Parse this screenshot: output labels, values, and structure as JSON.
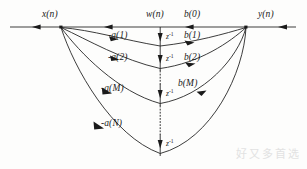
{
  "figure": {
    "type": "signal-flow-graph",
    "background_color": "#fdfdfc",
    "line_color": "#1a1a1a"
  },
  "labels": {
    "input": "x(n)",
    "state": "w(n)",
    "output": "y(n)",
    "b0": "b(0)"
  },
  "feedback_branches": [
    {
      "id": "a1",
      "label": "-a(1)",
      "x": 108,
      "y": 31
    },
    {
      "id": "a2",
      "label": "-a(2)",
      "x": 108,
      "y": 53
    },
    {
      "id": "aM",
      "label": "-a(M)",
      "x": 101,
      "y": 84
    },
    {
      "id": "aN",
      "label": "-a(N)",
      "x": 101,
      "y": 119
    }
  ],
  "feedforward_branches": [
    {
      "id": "b1",
      "label": "b(1)",
      "x": 184,
      "y": 31
    },
    {
      "id": "b2",
      "label": "b(2)",
      "x": 184,
      "y": 53
    },
    {
      "id": "bM",
      "label": "b(M)",
      "x": 178,
      "y": 79
    }
  ],
  "delay_elements": [
    {
      "id": "z1",
      "label": "z",
      "exponent": "-1",
      "x": 166,
      "y": 33
    },
    {
      "id": "z2",
      "label": "z",
      "exponent": "-1",
      "x": 166,
      "y": 55
    },
    {
      "id": "z3",
      "label": "z",
      "exponent": "-1",
      "x": 166,
      "y": 90
    },
    {
      "id": "z4",
      "label": "z",
      "exponent": "-1",
      "x": 166,
      "y": 140
    }
  ],
  "watermark": {
    "text": "好又多首选"
  },
  "geometry": {
    "main_line_y": 27,
    "left_node_x": 61,
    "right_node_x": 246,
    "delay_column_x": 160,
    "line_start_x": 10,
    "line_end_x": 296
  }
}
